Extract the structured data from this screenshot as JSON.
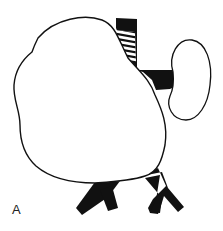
{
  "figure": {
    "panel_label": "A",
    "elements": [
      {
        "id": "mass",
        "name": "large mass outline"
      },
      {
        "id": "kidney",
        "name": "kidney outline"
      },
      {
        "id": "vessel",
        "name": "vertical vessel with hatched segment"
      },
      {
        "id": "renal-pedicle",
        "name": "horizontal vessel to kidney"
      },
      {
        "id": "left-bifurcation",
        "name": "bifurcating vessel left"
      },
      {
        "id": "right-bifurcation",
        "name": "bifurcating vessel right"
      }
    ],
    "colors": {
      "stroke": "#111111",
      "fill": "#111111",
      "background": "#ffffff"
    }
  }
}
